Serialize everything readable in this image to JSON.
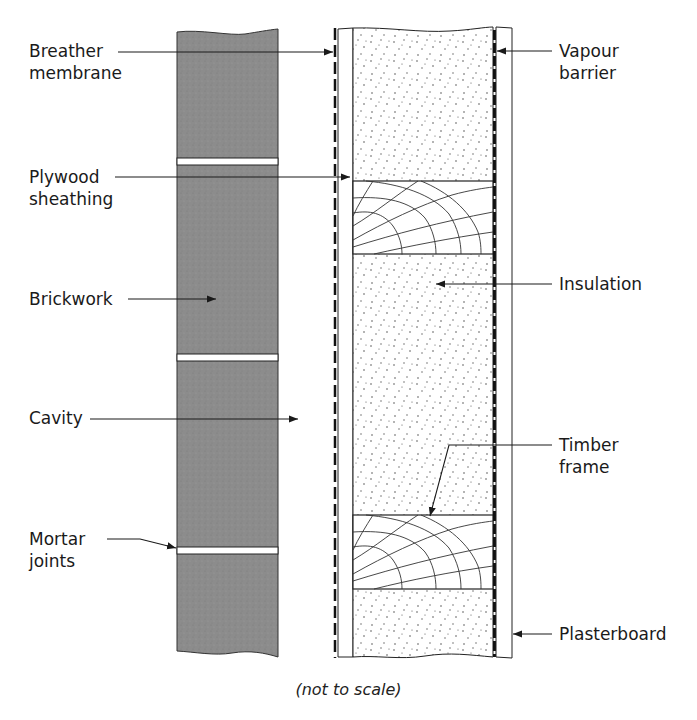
{
  "figure": {
    "type": "cross-section",
    "caption": "(not to scale)",
    "labels": {
      "breather_membrane": "Breather\nmembrane",
      "plywood_sheathing": "Plywood\nsheathing",
      "brickwork": "Brickwork",
      "cavity": "Cavity",
      "mortar_joints": "Mortar\njoints",
      "vapour_barrier": "Vapour\nbarrier",
      "insulation": "Insulation",
      "timber_frame": "Timber\nframe",
      "plasterboard": "Plasterboard"
    },
    "layers_outside_to_inside": [
      "Brickwork",
      "Cavity",
      "Breather membrane",
      "Plywood sheathing",
      "Insulation / Timber frame",
      "Vapour barrier",
      "Plasterboard"
    ],
    "colors": {
      "brick": "#8e8e8e",
      "line": "#1a1a1a",
      "mortar": "#ffffff",
      "background": "#ffffff"
    }
  }
}
